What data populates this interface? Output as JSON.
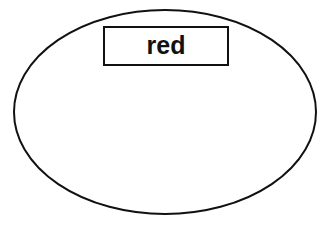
{
  "canvas": {
    "width": 329,
    "height": 228,
    "background_color": "#ffffff"
  },
  "diagram": {
    "type": "ellipse-with-label-box",
    "stroke_color": "#111111",
    "fill_color": "#ffffff",
    "ellipse": {
      "name": "outer-ellipse",
      "center_x": 165,
      "center_y": 112,
      "radius_x": 151,
      "radius_y": 102,
      "stroke_width": 2,
      "fill": "#ffffff"
    },
    "label_box": {
      "name": "label-rectangle",
      "x": 104,
      "y": 27,
      "width": 124,
      "height": 38,
      "stroke_width": 2,
      "fill": "#ffffff",
      "text": "red",
      "text_color": "#111111",
      "text_size": 25,
      "text_weight": "bold",
      "text_x": 166,
      "text_y": 47
    }
  }
}
